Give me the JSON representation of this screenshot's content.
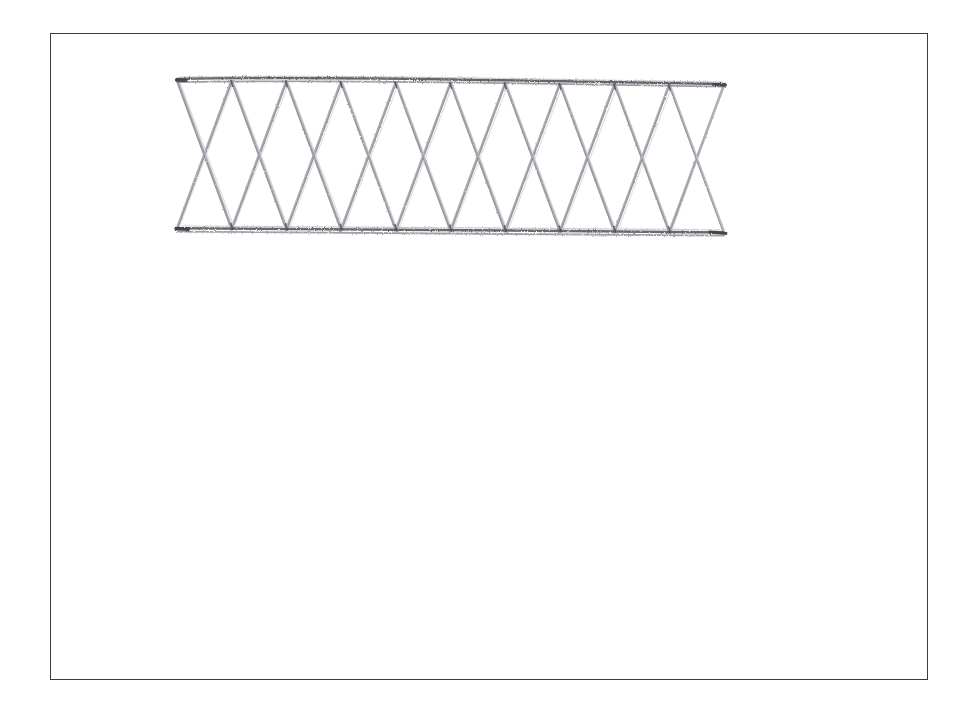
{
  "page": {
    "width": 978,
    "height": 715,
    "background_color": "#ffffff",
    "medium": "pencil sketch on white paper"
  },
  "frame": {
    "name": "drawing-border",
    "x": 50,
    "y": 33,
    "width": 878,
    "height": 647,
    "stroke_color": "#3b3b3d",
    "stroke_width": 1.5
  },
  "drawing": {
    "title": "Lattice truss elevation",
    "stroke_color_chord": "#6f7076",
    "stroke_color_diagonal": "#8d8e95",
    "stroke_color_light": "#aeafb5",
    "left_x": 177,
    "right_x": 724,
    "top_chord_y_left": 80,
    "top_chord_y_right": 85,
    "bottom_chord_y_left": 228,
    "bottom_chord_y_right": 232,
    "bay_count": 10,
    "x_brace_count": 5,
    "node_spacing": 54.7,
    "chord_nodes_top_x": [
      177,
      231.7,
      286.4,
      341.1,
      395.8,
      450.5,
      505.2,
      559.9,
      614.6,
      669.3,
      724
    ],
    "chord_nodes_bottom_x": [
      177,
      231.7,
      286.4,
      341.1,
      395.8,
      450.5,
      505.2,
      559.9,
      614.6,
      669.3,
      724
    ],
    "crossing_points_x": [
      204,
      259,
      313,
      368,
      423,
      478,
      532,
      587,
      642,
      696
    ],
    "crossing_points_y": [
      154,
      156,
      155,
      157,
      156,
      158,
      157,
      159,
      158,
      160
    ]
  },
  "chart_data": {
    "type": "line",
    "title": "Lattice truss elevation",
    "xlabel": "",
    "ylabel": "",
    "series": [
      {
        "name": "top-chord",
        "x": [
          177,
          724
        ],
        "values": [
          80,
          85
        ]
      },
      {
        "name": "bottom-chord",
        "x": [
          177,
          724
        ],
        "values": [
          228,
          232
        ]
      }
    ]
  }
}
